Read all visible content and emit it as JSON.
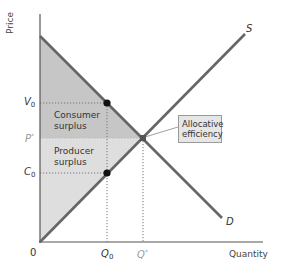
{
  "diagram": {
    "axes": {
      "y_label": "Price",
      "x_label": "Quantity",
      "origin_label": "0"
    },
    "price_ticks": [
      {
        "id": "V0",
        "base": "V",
        "sub": "0",
        "sup": ""
      },
      {
        "id": "Pstar",
        "base": "P",
        "sub": "",
        "sup": "*"
      },
      {
        "id": "C0",
        "base": "C",
        "sub": "0",
        "sup": ""
      }
    ],
    "quantity_ticks": [
      {
        "id": "Q0",
        "base": "Q",
        "sub": "0",
        "sup": ""
      },
      {
        "id": "Qstar",
        "base": "Q",
        "sub": "",
        "sup": "*"
      }
    ],
    "curves": {
      "supply_label": "S",
      "demand_label": "D"
    },
    "regions": {
      "consumer_surplus": [
        "Consumer",
        "surplus"
      ],
      "producer_surplus": [
        "Producer",
        "surplus"
      ]
    },
    "callout": {
      "lines": [
        "Allocative",
        "efficiency"
      ]
    },
    "colors": {
      "consumer_surplus_fill": "#c4c4c4",
      "producer_surplus_fill": "#dcdcdc",
      "curve_stroke": "#666666",
      "axis_stroke": "#555555",
      "point_fill": "#111111",
      "muted_label": "#9a9a9a"
    }
  }
}
